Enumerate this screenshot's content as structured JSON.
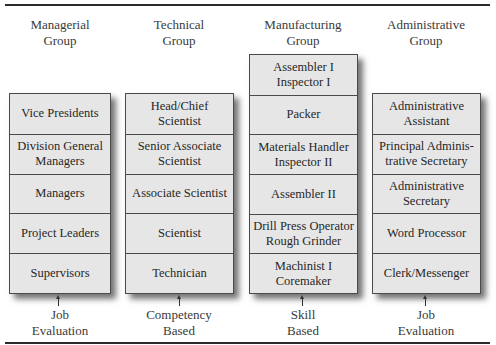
{
  "diagram": {
    "columns": [
      {
        "title": [
          "Managerial",
          "Group"
        ],
        "rows": [
          "Vice Presidents",
          "Division General Managers",
          "Managers",
          "Project Leaders",
          "Supervisors"
        ],
        "basis": [
          "Job",
          "Evaluation"
        ]
      },
      {
        "title": [
          "Technical",
          "Group"
        ],
        "rows": [
          "Head/Chief Scientist",
          "Senior Associate Scientist",
          "Associate Scientist",
          "Scientist",
          "Technician"
        ],
        "basis": [
          "Competency",
          "Based"
        ]
      },
      {
        "title": [
          "Manufacturing",
          "Group"
        ],
        "rows": [
          "Assembler I Inspector I",
          "Packer",
          "Materials Handler Inspector II",
          "Assembler II",
          "Drill Press Operator Rough Grinder",
          "Machinist I Coremaker"
        ],
        "basis": [
          "Skill",
          "Based"
        ]
      },
      {
        "title": [
          "Administrative",
          "Group"
        ],
        "rows": [
          "Administrative Assistant",
          "Principal Adminis-trative Secretary",
          "Administrative Secretary",
          "Word Processor",
          "Clerk/Messenger"
        ],
        "basis": [
          "Job",
          "Evaluation"
        ]
      }
    ],
    "row_lines": {
      "0": [
        [
          "Vice Presidents"
        ],
        [
          "Division General",
          "Managers"
        ],
        [
          "Managers"
        ],
        [
          "Project Leaders"
        ],
        [
          "Supervisors"
        ]
      ],
      "1": [
        [
          "Head/Chief",
          "Scientist"
        ],
        [
          "Senior Associate",
          "Scientist"
        ],
        [
          "Associate Scientist"
        ],
        [
          "Scientist"
        ],
        [
          "Technician"
        ]
      ],
      "2": [
        [
          "Assembler I",
          "Inspector I"
        ],
        [
          "Packer"
        ],
        [
          "Materials Handler",
          "Inspector II"
        ],
        [
          "Assembler II"
        ],
        [
          "Drill Press Operator",
          "Rough Grinder"
        ],
        [
          "Machinist I",
          "Coremaker"
        ]
      ],
      "3": [
        [
          "Administrative",
          "Assistant"
        ],
        [
          "Principal Adminis-",
          "trative Secretary"
        ],
        [
          "Administrative",
          "Secretary"
        ],
        [
          "Word Processor"
        ],
        [
          "Clerk/Messenger"
        ]
      ]
    }
  }
}
